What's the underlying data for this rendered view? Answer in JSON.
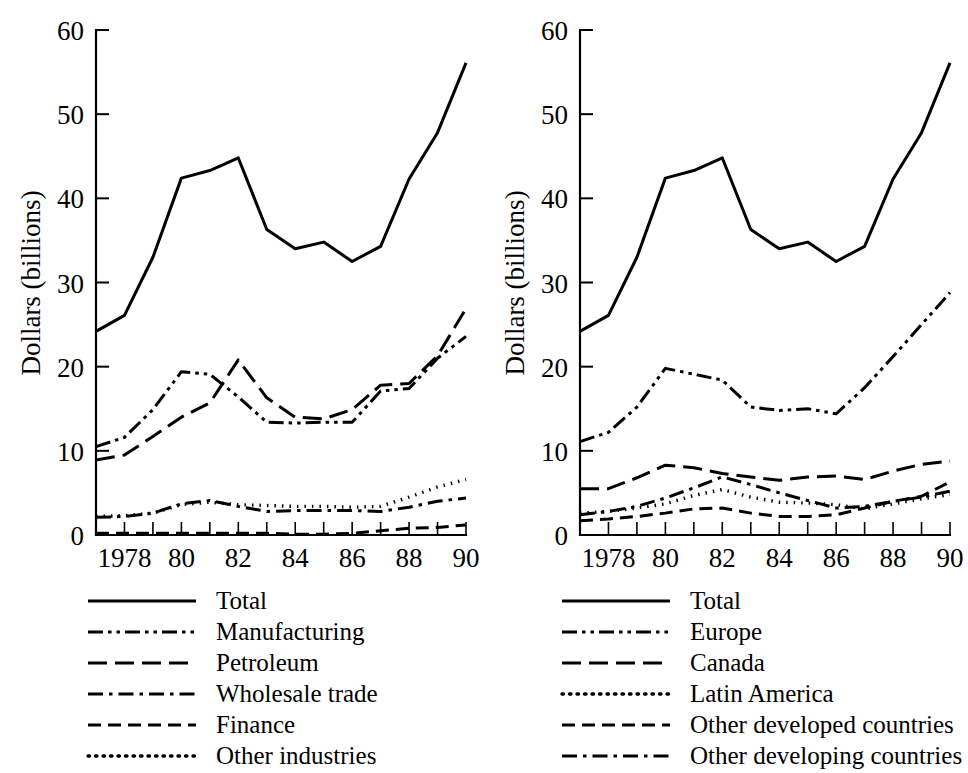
{
  "figure": {
    "background_color": "#ffffff",
    "line_color": "#000000",
    "panel_count": 2
  },
  "chart_data": [
    {
      "id": "left-panel",
      "type": "line",
      "title": "",
      "xlabel": "",
      "ylabel": "Dollars (billions)",
      "xlim": [
        1977,
        1990
      ],
      "ylim": [
        0,
        60
      ],
      "yticks": [
        0,
        10,
        20,
        30,
        40,
        50,
        60
      ],
      "ytick_labels": [
        "0",
        "10",
        "20",
        "30",
        "40",
        "50",
        "60"
      ],
      "x": [
        1977,
        1978,
        1979,
        1980,
        1981,
        1982,
        1983,
        1984,
        1985,
        1986,
        1987,
        1988,
        1989,
        1990
      ],
      "xticks": [
        1977,
        1978,
        1979,
        1980,
        1981,
        1982,
        1983,
        1984,
        1985,
        1986,
        1987,
        1988,
        1989,
        1990
      ],
      "xtick_labels": [
        "",
        "1978",
        "",
        "80",
        "",
        "82",
        "",
        "84",
        "",
        "86",
        "",
        "88",
        "",
        "90"
      ],
      "grid": false,
      "legend_position": "below",
      "series": [
        {
          "name": "Total",
          "dash": "solid",
          "values": [
            24.2,
            26.1,
            33.0,
            42.4,
            43.3,
            44.8,
            36.3,
            34.0,
            34.8,
            32.5,
            34.3,
            42.3,
            47.8,
            56.1
          ]
        },
        {
          "name": "Manufacturing",
          "dash": "dash-dot-dot",
          "values": [
            10.5,
            11.6,
            14.9,
            19.4,
            19.1,
            16.4,
            13.4,
            13.3,
            13.4,
            13.4,
            17.1,
            17.4,
            21.0,
            23.6
          ]
        },
        {
          "name": "Petroleum",
          "dash": "long-dash",
          "values": [
            8.9,
            9.5,
            11.7,
            14.0,
            15.7,
            20.8,
            16.3,
            14.0,
            13.8,
            14.9,
            17.8,
            18.0,
            21.3,
            26.9
          ]
        },
        {
          "name": "Wholesale trade",
          "dash": "dash-dot",
          "values": [
            2.1,
            2.2,
            2.6,
            3.7,
            4.1,
            3.4,
            2.8,
            2.9,
            2.9,
            2.9,
            2.8,
            3.3,
            4.0,
            4.4
          ]
        },
        {
          "name": "Finance",
          "dash": "dash",
          "values": [
            0.2,
            0.2,
            0.2,
            0.2,
            0.2,
            0.2,
            0.2,
            0.1,
            0.1,
            0.2,
            0.5,
            0.8,
            0.9,
            1.2
          ]
        },
        {
          "name": "Other industries",
          "dash": "dot",
          "values": [
            2.2,
            2.3,
            2.6,
            3.6,
            3.9,
            3.6,
            3.5,
            3.4,
            3.4,
            3.3,
            3.4,
            4.5,
            5.7,
            6.6
          ]
        }
      ]
    },
    {
      "id": "right-panel",
      "type": "line",
      "title": "",
      "xlabel": "",
      "ylabel": "Dollars (billions)",
      "xlim": [
        1977,
        1990
      ],
      "ylim": [
        0,
        60
      ],
      "yticks": [
        0,
        10,
        20,
        30,
        40,
        50,
        60
      ],
      "ytick_labels": [
        "0",
        "10",
        "20",
        "30",
        "40",
        "50",
        "60"
      ],
      "x": [
        1977,
        1978,
        1979,
        1980,
        1981,
        1982,
        1983,
        1984,
        1985,
        1986,
        1987,
        1988,
        1989,
        1990
      ],
      "xticks": [
        1977,
        1978,
        1979,
        1980,
        1981,
        1982,
        1983,
        1984,
        1985,
        1986,
        1987,
        1988,
        1989,
        1990
      ],
      "xtick_labels": [
        "",
        "1978",
        "",
        "80",
        "",
        "82",
        "",
        "84",
        "",
        "86",
        "",
        "88",
        "",
        "90"
      ],
      "grid": false,
      "legend_position": "below",
      "series": [
        {
          "name": "Total",
          "dash": "solid",
          "values": [
            24.2,
            26.1,
            33.0,
            42.4,
            43.3,
            44.8,
            36.3,
            34.0,
            34.8,
            32.5,
            34.3,
            42.3,
            47.8,
            56.1
          ]
        },
        {
          "name": "Europe",
          "dash": "dash-dot-dot",
          "values": [
            11.1,
            12.2,
            15.2,
            19.8,
            19.1,
            18.4,
            15.2,
            14.8,
            15.0,
            14.4,
            17.5,
            21.2,
            25.0,
            28.8
          ]
        },
        {
          "name": "Canada",
          "dash": "long-dash",
          "values": [
            5.5,
            5.5,
            6.8,
            8.3,
            8.0,
            7.3,
            6.9,
            6.5,
            6.9,
            7.0,
            6.6,
            7.6,
            8.4,
            8.8
          ]
        },
        {
          "name": "Latin America",
          "dash": "dot",
          "values": [
            2.6,
            2.8,
            3.2,
            3.7,
            4.7,
            5.4,
            4.5,
            3.9,
            3.8,
            3.6,
            3.1,
            3.7,
            4.3,
            4.8
          ]
        },
        {
          "name": "Other developed countries",
          "dash": "dash",
          "values": [
            1.7,
            1.9,
            2.2,
            2.6,
            3.1,
            3.2,
            2.6,
            2.2,
            2.2,
            2.4,
            3.2,
            4.0,
            4.6,
            6.3
          ]
        },
        {
          "name": "Other developing countries",
          "dash": "dash-dot",
          "values": [
            2.4,
            2.8,
            3.4,
            4.4,
            5.6,
            6.9,
            6.0,
            5.0,
            4.1,
            3.2,
            3.4,
            4.0,
            4.5,
            5.2
          ]
        }
      ]
    }
  ]
}
